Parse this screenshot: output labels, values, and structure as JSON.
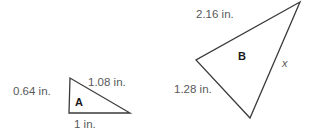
{
  "figure": {
    "background_color": "#ffffff",
    "stroke_color": "#3b3b3b",
    "label_color": "#58595b",
    "name_color": "#1a1a1a"
  },
  "triangle_a": {
    "name": "A",
    "side_left": "0.64 in.",
    "side_hypotenuse": "1.08 in.",
    "side_base": "1 in.",
    "vertices": "70,78 69,113 130,113"
  },
  "triangle_b": {
    "name": "B",
    "side_top": "2.16 in.",
    "side_left": "1.28 in.",
    "side_unknown": "x",
    "vertices": "300,2 196,60 250,118"
  },
  "chart_data": {
    "type": "diagram",
    "shapes": [
      {
        "label": "A",
        "kind": "triangle",
        "sides": [
          {
            "name": "left",
            "value": 0.64,
            "unit": "in.",
            "text": "0.64 in."
          },
          {
            "name": "hypotenuse",
            "value": 1.08,
            "unit": "in.",
            "text": "1.08 in."
          },
          {
            "name": "base",
            "value": 1,
            "unit": "in.",
            "text": "1 in."
          }
        ]
      },
      {
        "label": "B",
        "kind": "triangle",
        "sides": [
          {
            "name": "top",
            "value": 2.16,
            "unit": "in.",
            "text": "2.16 in."
          },
          {
            "name": "left",
            "value": 1.28,
            "unit": "in.",
            "text": "1.28 in."
          },
          {
            "name": "right",
            "value": null,
            "unit": "in.",
            "text": "x"
          }
        ]
      }
    ]
  }
}
